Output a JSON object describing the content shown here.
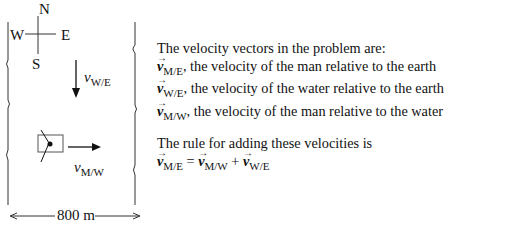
{
  "figure": {
    "compass": {
      "north": "N",
      "south": "S",
      "east": "E",
      "west": "W"
    },
    "water_velocity_label": {
      "symbol": "v",
      "subscript": "W/E"
    },
    "man_velocity_label": {
      "symbol": "v",
      "subscript": "M/W"
    },
    "width_label": "800 m"
  },
  "text": {
    "intro": "The velocity vectors in the problem are:",
    "vectors": [
      {
        "symbol": "v",
        "subscript": "M/E",
        "description": ", the velocity of the man relative to the earth"
      },
      {
        "symbol": "v",
        "subscript": "W/E",
        "description": ", the velocity of the water relative to the earth"
      },
      {
        "symbol": "v",
        "subscript": "M/W",
        "description": ", the velocity of the man relative to the water"
      }
    ],
    "rule_intro": "The rule for adding these velocities is",
    "equation": {
      "lhs": {
        "symbol": "v",
        "subscript": "M/E"
      },
      "equals": " = ",
      "term1": {
        "symbol": "v",
        "subscript": "M/W"
      },
      "plus": " + ",
      "term2": {
        "symbol": "v",
        "subscript": "W/E"
      }
    }
  }
}
